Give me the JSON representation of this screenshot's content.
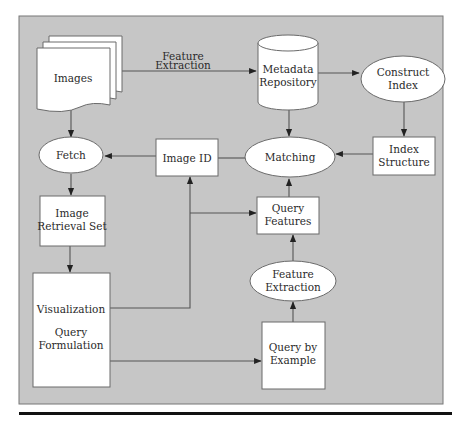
{
  "diagram": {
    "type": "flowchart",
    "title": "",
    "colors": {
      "background": "#c6c6c6",
      "node_fill": "#ffffff",
      "node_stroke": "#6a6a6a",
      "edge": "#555555",
      "text": "#2a2a2a",
      "rule": "#111111"
    },
    "nodes": {
      "images": {
        "shape": "document-stack",
        "label": "Images"
      },
      "metadata_repository": {
        "shape": "cylinder",
        "line1": "Metadata",
        "line2": "Repository"
      },
      "construct_index": {
        "shape": "ellipse",
        "line1": "Construct",
        "line2": "Index"
      },
      "index_structure": {
        "shape": "rectangle",
        "line1": "Index",
        "line2": "Structure"
      },
      "matching": {
        "shape": "ellipse",
        "label": "Matching"
      },
      "image_id": {
        "shape": "rectangle",
        "label": "Image ID"
      },
      "fetch": {
        "shape": "ellipse",
        "label": "Fetch"
      },
      "image_retrieval_set": {
        "shape": "rectangle",
        "line1": "Image",
        "line2": "Retrieval Set"
      },
      "visualization_query_formulation": {
        "shape": "rectangle",
        "line1": "Visualization",
        "line2": "Query",
        "line3": "Formulation"
      },
      "query_features": {
        "shape": "rectangle",
        "line1": "Query",
        "line2": "Features"
      },
      "feature_extraction": {
        "shape": "ellipse",
        "line1": "Feature",
        "line2": "Extraction"
      },
      "query_by_example": {
        "shape": "rectangle",
        "line1": "Query by",
        "line2": "Example"
      }
    },
    "edge_labels": {
      "images_to_metadata": {
        "line1": "Feature",
        "line2": "Extraction"
      }
    },
    "edges": [
      {
        "from": "Images",
        "to": "Metadata Repository",
        "label": "Feature Extraction"
      },
      {
        "from": "Metadata Repository",
        "to": "Construct Index"
      },
      {
        "from": "Construct Index",
        "to": "Index Structure"
      },
      {
        "from": "Index Structure",
        "to": "Matching"
      },
      {
        "from": "Metadata Repository",
        "to": "Matching"
      },
      {
        "from": "Matching",
        "to": "Image ID"
      },
      {
        "from": "Image ID",
        "to": "Fetch"
      },
      {
        "from": "Images",
        "to": "Fetch"
      },
      {
        "from": "Fetch",
        "to": "Image Retrieval Set"
      },
      {
        "from": "Image Retrieval Set",
        "to": "Visualization Query Formulation"
      },
      {
        "from": "Visualization Query Formulation",
        "to": "Image ID"
      },
      {
        "from": "Visualization Query Formulation",
        "to": "Query Features"
      },
      {
        "from": "Visualization Query Formulation",
        "to": "Query by Example"
      },
      {
        "from": "Query by Example",
        "to": "Feature Extraction"
      },
      {
        "from": "Feature Extraction",
        "to": "Query Features"
      },
      {
        "from": "Query Features",
        "to": "Matching"
      }
    ]
  }
}
